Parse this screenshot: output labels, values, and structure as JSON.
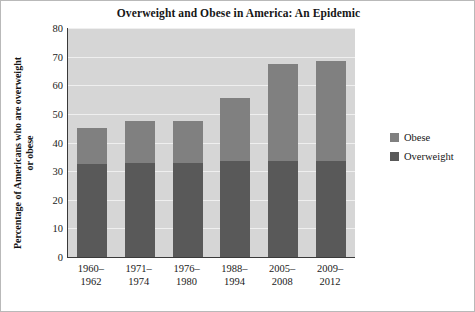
{
  "chart_data": {
    "type": "bar",
    "subtype": "stacked-vertical",
    "title": "Overweight and Obese in America: An Epidemic",
    "xlabel": "",
    "ylabel": "Percentage of Americans who are overweight or obese",
    "ylim": [
      0,
      80
    ],
    "ytick_step": 10,
    "yticks": [
      "80",
      "70",
      "60",
      "50",
      "40",
      "30",
      "20",
      "10",
      "0"
    ],
    "grid": true,
    "grid_axis": "y",
    "legend_position": "right",
    "categories": [
      "1960–\n1962",
      "1971–\n1974",
      "1976–\n1980",
      "1988–\n1994",
      "2005–\n2008",
      "2009–\n2012"
    ],
    "categories_line1": [
      "1960–",
      "1971–",
      "1976–",
      "1988–",
      "2005–",
      "2009–"
    ],
    "categories_line2": [
      "1962",
      "1974",
      "1980",
      "1994",
      "2008",
      "2012"
    ],
    "series": [
      {
        "name": "Overweight",
        "color": "#595959",
        "values": [
          32.5,
          33.0,
          33.0,
          33.5,
          33.5,
          33.5
        ]
      },
      {
        "name": "Obese",
        "color": "#808080",
        "values": [
          12.5,
          14.5,
          14.5,
          22.0,
          34.0,
          35.0
        ]
      }
    ],
    "totals": [
      45.0,
      47.5,
      47.5,
      55.5,
      67.5,
      68.5
    ],
    "plot_background": "#d6d6d6",
    "figure_background": "#ffffff",
    "gridline_color": "#efefef",
    "axis_color": "#3a3a3a"
  },
  "legend": {
    "items": [
      {
        "label": "Obese",
        "color": "#808080"
      },
      {
        "label": "Overweight",
        "color": "#595959"
      }
    ]
  }
}
